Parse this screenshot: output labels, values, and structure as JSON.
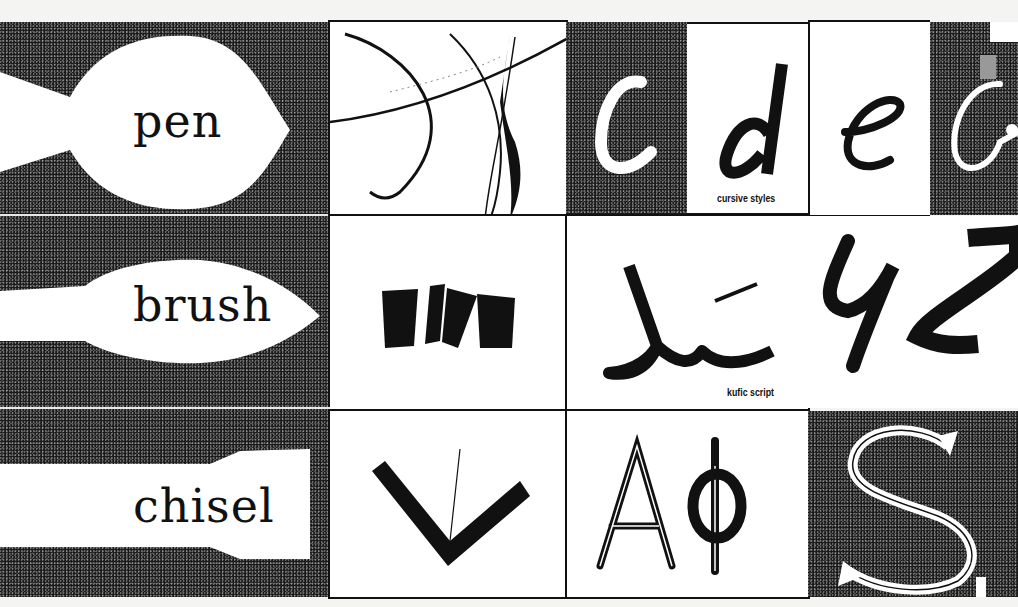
{
  "tools": {
    "pen": "pen",
    "brush": "brush",
    "chisel": "chisel"
  },
  "captions": {
    "cursive": "cursive styles",
    "kufic": "kufic script"
  },
  "letters": {
    "c": "c",
    "d": "d",
    "e": "e",
    "g": "G",
    "a": "A",
    "phi": "Φ",
    "s": "S"
  },
  "colors": {
    "ink": "#111111",
    "paper": "#ffffff",
    "stipple": "#1a1a1a"
  }
}
